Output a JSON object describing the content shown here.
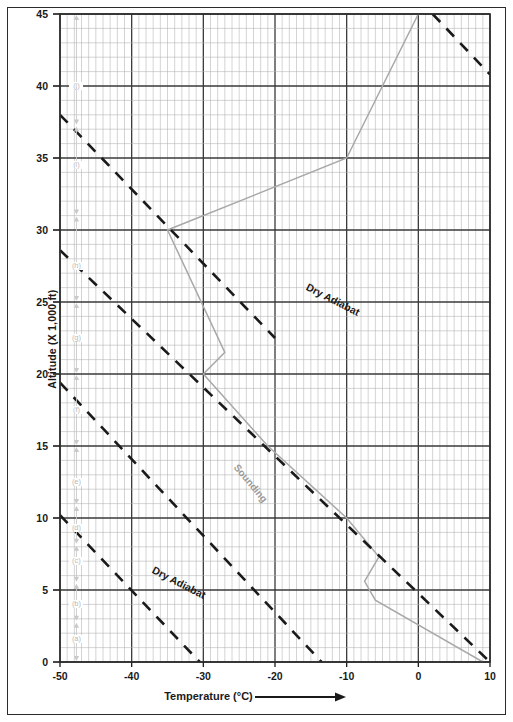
{
  "chart_data": {
    "type": "line",
    "title": "",
    "xlabel": "Temperature (°C)",
    "ylabel": "Altitude (X 1,000 ft)",
    "xlim": [
      -50,
      10
    ],
    "ylim": [
      0,
      45
    ],
    "xticks": [
      -50,
      -40,
      -30,
      -20,
      -10,
      0,
      10
    ],
    "yticks": [
      0,
      5,
      10,
      15,
      20,
      25,
      30,
      35,
      40,
      45
    ],
    "xtick_labels": [
      "-50",
      "-40",
      "-30",
      "-20",
      "-10",
      "0",
      "10"
    ],
    "ytick_labels": [
      "0",
      "5",
      "10",
      "15",
      "20",
      "25",
      "30",
      "35",
      "40",
      "45"
    ],
    "x_minor_step": 1,
    "y_minor_step": 1,
    "grid": true,
    "legend": "none",
    "series": [
      {
        "name": "Sounding",
        "style": "solid",
        "color": "#a8a8a8",
        "points": [
          {
            "t": 9.0,
            "alt": 0.0
          },
          {
            "t": -6.0,
            "alt": 4.3
          },
          {
            "t": -7.5,
            "alt": 5.6
          },
          {
            "t": -5.5,
            "alt": 7.3
          },
          {
            "t": -10.0,
            "alt": 10.0
          },
          {
            "t": -21.0,
            "alt": 15.0
          },
          {
            "t": -30.0,
            "alt": 20.0
          },
          {
            "t": -27.0,
            "alt": 21.5
          },
          {
            "t": -35.0,
            "alt": 30.0
          },
          {
            "t": -10.0,
            "alt": 35.0
          },
          {
            "t": 0.0,
            "alt": 45.0
          }
        ]
      },
      {
        "name": "Dry Adiabat",
        "style": "dashed",
        "color": "#1a1a1a",
        "points": [
          {
            "t": -50.0,
            "alt": 38.0
          },
          {
            "t": -20.0,
            "alt": 22.5
          }
        ]
      },
      {
        "name": "Dry Adiabat",
        "style": "dashed",
        "color": "#1a1a1a",
        "points": [
          {
            "t": -50.0,
            "alt": 28.6
          },
          {
            "t": 10.0,
            "alt": 0.0
          }
        ]
      },
      {
        "name": "Dry Adiabat",
        "style": "dashed",
        "color": "#1a1a1a",
        "points": [
          {
            "t": -50.0,
            "alt": 19.4
          },
          {
            "t": -13.5,
            "alt": 0.0
          }
        ]
      },
      {
        "name": "Dry Adiabat",
        "style": "dashed",
        "color": "#1a1a1a",
        "points": [
          {
            "t": -50.0,
            "alt": 10.2
          },
          {
            "t": -30.5,
            "alt": 0.0
          }
        ]
      },
      {
        "name": "Dry Adiabat",
        "style": "dashed",
        "color": "#1a1a1a",
        "points": [
          {
            "t": 2.0,
            "alt": 45.0
          },
          {
            "t": 10.0,
            "alt": 40.8
          }
        ]
      }
    ],
    "annotations": [
      {
        "text": "Dry Adiabat",
        "t": -15.5,
        "alt": 26.5,
        "rotation": 27,
        "color": "#1a1a1a"
      },
      {
        "text": "Dry Adiabat",
        "t": -37.0,
        "alt": 6.9,
        "rotation": 27,
        "color": "#1a1a1a"
      },
      {
        "text": "Sounding",
        "t": -25.5,
        "alt": 14.0,
        "rotation": 50,
        "color": "#9a9a9a"
      }
    ],
    "segment_markers": {
      "t": -47.7,
      "labels": [
        "(a)",
        "(b)",
        "(c)",
        "(d)",
        "(e)",
        "(f)",
        "(g)",
        "(h)",
        "(i)",
        "(j)"
      ],
      "altitudes": [
        1.6,
        4.0,
        7.0,
        9.3,
        12.5,
        17.5,
        22.5,
        27.5,
        34.5,
        40.0
      ]
    }
  }
}
